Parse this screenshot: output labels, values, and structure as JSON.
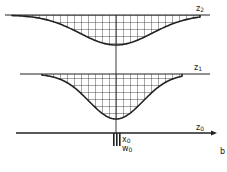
{
  "diagram": {
    "panel_label": "b",
    "levels": [
      {
        "id": "z2",
        "label": "z",
        "subscript": "2",
        "y": 15,
        "x_start": 5,
        "x_end": 210,
        "depth_y": 45,
        "curve_x_start": 12,
        "curve_x_end": 200
      },
      {
        "id": "z1",
        "label": "z",
        "subscript": "1",
        "y": 74,
        "x_start": 20,
        "x_end": 210,
        "depth_y": 119,
        "curve_x_start": 42,
        "curve_x_end": 182
      }
    ],
    "axis": {
      "id": "z0",
      "label": "z",
      "subscript": "0",
      "y": 133,
      "x_start": 16,
      "x_end": 217
    },
    "source": {
      "label_x": "x",
      "label_x_sub": "0",
      "label_w": "w",
      "label_w_sub": "0",
      "x": 116
    },
    "center_x": 116,
    "grid_spacing": 7,
    "colors": {
      "ink": "#222222",
      "background": "#ffffff"
    }
  }
}
